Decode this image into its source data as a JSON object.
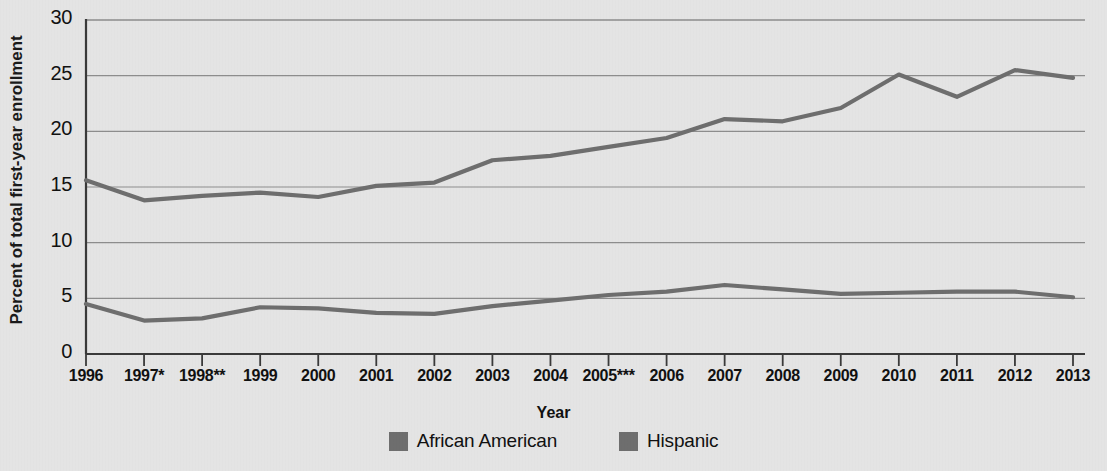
{
  "chart_data": {
    "type": "line",
    "title": "",
    "xlabel": "Year",
    "ylabel": "Percent of total first-year enrollment",
    "categories": [
      "1996",
      "1997*",
      "1998**",
      "1999",
      "2000",
      "2001",
      "2002",
      "2003",
      "2004",
      "2005***",
      "2006",
      "2007",
      "2008",
      "2009",
      "2010",
      "2011",
      "2012",
      "2013"
    ],
    "x_tick_labels": [
      "1996",
      "1997*",
      "1998**",
      "1999",
      "2000",
      "2001",
      "2002",
      "2003",
      "2004",
      "2005***",
      "2006",
      "2007",
      "2008",
      "2009",
      "2010",
      "2011",
      "2012",
      "2013"
    ],
    "y_tick_labels": [
      "0",
      "5",
      "10",
      "15",
      "20",
      "25",
      "30"
    ],
    "y_ticks": [
      0,
      5,
      10,
      15,
      20,
      25,
      30
    ],
    "ylim": [
      0,
      30
    ],
    "grid": true,
    "legend_position": "bottom",
    "series": [
      {
        "name": "African American",
        "color": "#6e6e6e",
        "values": [
          15.6,
          13.8,
          14.2,
          14.5,
          14.1,
          15.1,
          15.4,
          17.4,
          17.8,
          18.6,
          19.4,
          21.1,
          20.9,
          22.1,
          25.1,
          23.1,
          25.5,
          24.8
        ]
      },
      {
        "name": "Hispanic",
        "color": "#6e6e6e",
        "values": [
          4.5,
          3.0,
          3.2,
          4.2,
          4.1,
          3.7,
          3.6,
          4.3,
          4.8,
          5.3,
          5.6,
          6.2,
          5.8,
          5.4,
          5.5,
          5.6,
          5.6,
          5.1
        ]
      }
    ]
  },
  "style": {
    "background": "#e4e4e4",
    "line_color": "#6e6e6e",
    "axis_color": "#3a3a3a",
    "grid_color": "#8d8d8d",
    "text_color": "#111111"
  },
  "legend": {
    "items": [
      {
        "label": "African American",
        "swatch_color": "#6e6e6e"
      },
      {
        "label": "Hispanic",
        "swatch_color": "#6e6e6e"
      }
    ]
  },
  "axis": {
    "x_title": "Year",
    "y_title": "Percent of total first-year enrollment"
  }
}
